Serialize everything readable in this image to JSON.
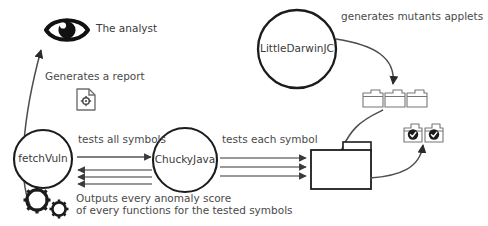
{
  "diagram": {
    "canvas": {
      "width": 488,
      "height": 226,
      "background": "#ffffff"
    },
    "colors": {
      "stroke_dark": "#1c1c1c",
      "stroke_mid": "#555555",
      "stroke_light": "#8a8a8a",
      "text": "#4a4a4a",
      "circle_text": "#3b3b3b",
      "icon_outline": "#6f6f6f"
    },
    "nodes": [
      {
        "id": "fetchvuln",
        "shape": "circle",
        "label": "fetchVuln"
      },
      {
        "id": "chuckyjava",
        "shape": "circle",
        "label": "ChuckyJava"
      },
      {
        "id": "littledarwinjc",
        "shape": "circle",
        "label": "LittleDarwinJC"
      }
    ],
    "icons": [
      {
        "id": "eye",
        "name": "eye-icon",
        "label": "The analyst"
      },
      {
        "id": "report",
        "name": "report-document-icon",
        "label": "Generates a report"
      },
      {
        "id": "gears",
        "name": "gears-icon",
        "label": "Outputs every anomaly score"
      },
      {
        "id": "mutant-applets",
        "name": "applet-folder-icon",
        "count": 3
      },
      {
        "id": "verified-applets",
        "name": "verified-applet-folder-icon",
        "count": 2
      },
      {
        "id": "results-folder",
        "name": "folder-icon",
        "count": 1
      }
    ],
    "labels": {
      "analyst": "The analyst",
      "generates_report": "Generates a report",
      "tests_all_symbols": "tests all symbols",
      "tests_each_symbol": "tests each symbol",
      "generates_mutants_applets": "generates mutants applets",
      "outputs_line1": "Outputs every anomaly score",
      "outputs_line2": "of every functions for the tested symbols"
    },
    "edges": [
      {
        "id": "e1",
        "from": "fetchvuln",
        "to": "chuckyjava",
        "label": "tests all symbols",
        "direction": "right",
        "count": 1
      },
      {
        "id": "e2",
        "from": "chuckyjava",
        "to": "fetchvuln",
        "label": "",
        "direction": "left",
        "count": 3
      },
      {
        "id": "e3",
        "from": "chuckyjava",
        "to": "results-folder",
        "label": "tests each symbol",
        "direction": "right",
        "count": 3
      },
      {
        "id": "e4",
        "from": "littledarwinjc",
        "to": "mutant-applets",
        "label": "generates mutants applets",
        "direction": "curve-down"
      },
      {
        "id": "e5",
        "from": "mutant-applets",
        "to": "results-folder",
        "label": "",
        "direction": "curve-down"
      },
      {
        "id": "e6",
        "from": "results-folder",
        "to": "verified-applets",
        "label": "",
        "direction": "curve-up"
      },
      {
        "id": "e7",
        "from": "fetchvuln",
        "to": "eye",
        "label": "Generates a report",
        "direction": "curve-up"
      }
    ]
  }
}
